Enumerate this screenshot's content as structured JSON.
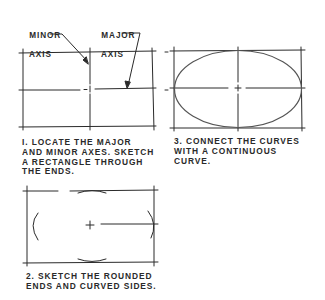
{
  "labels": {
    "minor_axis": [
      "MINOR",
      "AXIS"
    ],
    "major_axis": [
      "MAJOR",
      "AXIS"
    ]
  },
  "steps": [
    {
      "number": "1",
      "lines": [
        "I. LOCATE THE MAJOR",
        "AND MINOR AXES. SKETCH",
        "A RECTANGLE THROUGH",
        "THE ENDS."
      ]
    },
    {
      "number": "2",
      "lines": [
        "2. SKETCH THE ROUNDED",
        "ENDS AND CURVED SIDES."
      ]
    },
    {
      "number": "3",
      "lines": [
        "3. CONNECT THE CURVES",
        "WITH A CONTINUOUS",
        "CURVE."
      ]
    }
  ],
  "colors": {
    "ink": "#2a2a2a",
    "ellipse": "#555555",
    "background": "#ffffff"
  }
}
